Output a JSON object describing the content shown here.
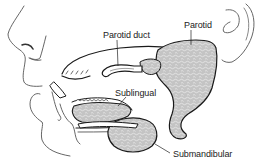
{
  "figure": {
    "background_color": "#ffffff",
    "line_color": "#1a1a1a",
    "gland_fill_color": "#c9c9c9",
    "gland_texture_color": "#f2f2f2"
  },
  "labels": {
    "parotid_duct": "Parotid duct",
    "parotid": "Parotid",
    "sublingual": "Sublingual",
    "submandibular": "Submandibular"
  },
  "structures": [
    {
      "name": "Parotid",
      "label_key": "parotid"
    },
    {
      "name": "Parotid duct",
      "label_key": "parotid_duct"
    },
    {
      "name": "Sublingual",
      "label_key": "sublingual"
    },
    {
      "name": "Submandibular",
      "label_key": "submandibular"
    }
  ]
}
